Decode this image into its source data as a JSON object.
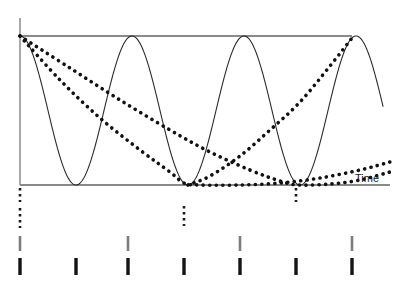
{
  "figure": {
    "title": "",
    "axis_label_time": "Time",
    "colors": {
      "axis": "#6e6e6e",
      "ceiling": "#8a8a8a",
      "baseline": "#8a8a8a",
      "carrier": "#2b2b2b",
      "envelope": "#111111",
      "tick_major": "#7d7d7d",
      "tick_minor": "#141414",
      "background": "#ffffff"
    }
  },
  "chart_data": {
    "type": "line",
    "title": "",
    "subtitle": "",
    "xlabel": "Time",
    "ylabel": "",
    "grid": false,
    "legend": false,
    "axis_ranges": {
      "x_pixels": [
        20,
        390
      ],
      "y_pixels": [
        36,
        185
      ],
      "x_origin": 20,
      "y_top": 36,
      "y_baseline": 185
    },
    "series": [
      {
        "name": "ceiling",
        "style": "solid-thick-gray",
        "role": "upper bound line",
        "points": [
          [
            20,
            36
          ],
          [
            352,
            36
          ]
        ]
      },
      {
        "name": "baseline",
        "style": "solid-gray",
        "role": "zero line",
        "points": [
          [
            20,
            185
          ],
          [
            390,
            185
          ]
        ]
      },
      {
        "name": "vertical-axis",
        "style": "solid-gray",
        "role": "y axis",
        "points": [
          [
            20,
            18
          ],
          [
            20,
            185
          ]
        ]
      },
      {
        "name": "carrier",
        "style": "solid-thin-black",
        "role": "oscillating carrier wave",
        "period_px": 112,
        "amplitude_top": 36,
        "amplitude_bottom": 185,
        "peaks_x": [
          20,
          132,
          244,
          352
        ],
        "troughs_x": [
          76,
          188,
          298
        ],
        "ends_at": [
          383,
          100
        ]
      },
      {
        "name": "envelope-fast-decay",
        "style": "dotted-thick-black",
        "role": "rapidly decaying envelope reaching baseline near x=184",
        "points": [
          [
            20,
            36
          ],
          [
            60,
            80
          ],
          [
            100,
            118
          ],
          [
            140,
            150
          ],
          [
            170,
            172
          ],
          [
            184,
            183
          ],
          [
            200,
            185
          ],
          [
            240,
            185
          ],
          [
            280,
            183
          ],
          [
            320,
            178
          ],
          [
            360,
            170
          ],
          [
            390,
            162
          ]
        ]
      },
      {
        "name": "envelope-slow-decay",
        "style": "dotted-thick-black",
        "role": "slowly decaying envelope reaching baseline near x=298",
        "points": [
          [
            20,
            36
          ],
          [
            70,
            68
          ],
          [
            120,
            100
          ],
          [
            170,
            130
          ],
          [
            210,
            152
          ],
          [
            250,
            170
          ],
          [
            280,
            181
          ],
          [
            298,
            185
          ],
          [
            330,
            184
          ],
          [
            360,
            180
          ],
          [
            390,
            172
          ]
        ]
      },
      {
        "name": "envelope-recovery",
        "style": "dotted-thick-black",
        "role": "envelope rising from baseline back to the ceiling at x=352",
        "points": [
          [
            188,
            185
          ],
          [
            210,
            176
          ],
          [
            240,
            156
          ],
          [
            270,
            130
          ],
          [
            300,
            102
          ],
          [
            330,
            66
          ],
          [
            352,
            38
          ]
        ]
      }
    ],
    "drop_markers": [
      {
        "name": "drop-origin-upper",
        "x": 20,
        "y_from": 188,
        "y_to": 202,
        "style": "dotted"
      },
      {
        "name": "drop-origin-lower",
        "x": 20,
        "y_from": 208,
        "y_to": 228,
        "style": "dotted"
      },
      {
        "name": "drop-mid",
        "x": 184,
        "y_from": 206,
        "y_to": 226,
        "style": "dotted"
      },
      {
        "name": "drop-right",
        "x": 296,
        "y_from": 188,
        "y_to": 202,
        "style": "dotted"
      }
    ],
    "tick_rows": [
      {
        "name": "major-ticks",
        "color": "#7d7d7d",
        "y_from": 236,
        "y_to": 251,
        "positions": [
          20,
          128,
          240,
          352
        ],
        "count": 4
      },
      {
        "name": "minor-ticks",
        "color": "#141414",
        "y_from": 258,
        "y_to": 275,
        "positions": [
          20,
          76,
          128,
          184,
          240,
          296,
          352
        ],
        "count": 7
      }
    ]
  }
}
